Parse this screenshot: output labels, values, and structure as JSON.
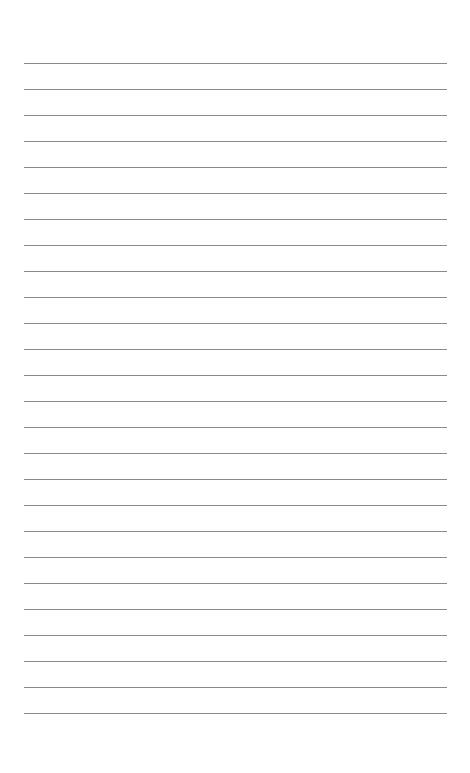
{
  "page": {
    "type": "lined-paper",
    "background_color": "#ffffff",
    "line_color": "#8a8a8a",
    "line_count": 26,
    "first_line_y": 63,
    "line_spacing": 26,
    "line_left": 24,
    "line_width": 423
  }
}
